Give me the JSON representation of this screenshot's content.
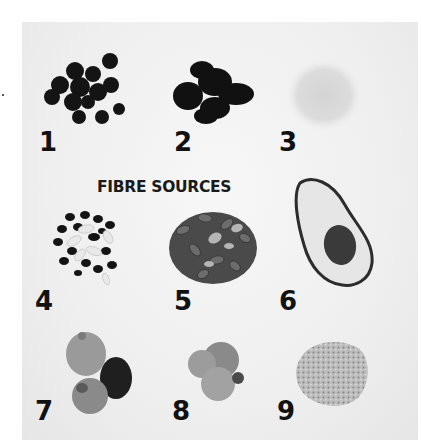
{
  "figure": {
    "title": "FIBRE SOURCES",
    "items": [
      {
        "number": "1",
        "subject": "blueberries"
      },
      {
        "number": "2",
        "subject": "dried prunes / dark dried fruit"
      },
      {
        "number": "3",
        "subject": "powder / bran"
      },
      {
        "number": "4",
        "subject": "mixed black and white beans"
      },
      {
        "number": "5",
        "subject": "pumpkin seeds"
      },
      {
        "number": "6",
        "subject": "halved avocado"
      },
      {
        "number": "7",
        "subject": "dried figs"
      },
      {
        "number": "8",
        "subject": "dried apricots"
      },
      {
        "number": "9",
        "subject": "grains / oats"
      }
    ]
  }
}
